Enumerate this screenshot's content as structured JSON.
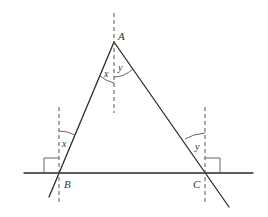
{
  "diagram": {
    "type": "geometry",
    "colors": {
      "line": "#2b2b2b",
      "aux": "#555555",
      "background": "#ffffff"
    },
    "points": {
      "A": {
        "label": "A",
        "x": 114,
        "y": 42
      },
      "B": {
        "label": "B",
        "x": 59,
        "y": 173
      },
      "C": {
        "label": "C",
        "x": 205,
        "y": 173
      }
    },
    "angle_labels": {
      "A_left": "x",
      "A_right": "y",
      "B": "x",
      "C": "y"
    },
    "elements": [
      "segment AB extended beyond B",
      "segment AC extended beyond C",
      "horizontal line through B and C",
      "dashed vertical through A",
      "dashed vertical through B",
      "dashed vertical through C",
      "right-angle marker at B (left of vertical)",
      "right-angle marker at C (right of vertical)"
    ]
  }
}
